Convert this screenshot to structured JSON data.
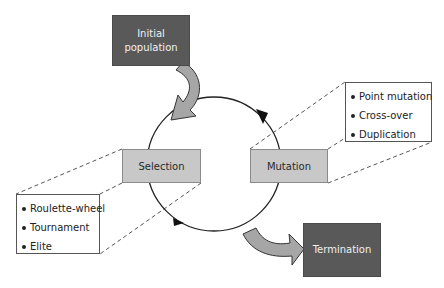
{
  "diagram": {
    "initial": {
      "label": "Initial population"
    },
    "selection": {
      "label": "Selection",
      "methods": [
        "Roulette-wheel",
        "Tournament",
        "Elite"
      ]
    },
    "mutation": {
      "label": "Mutation",
      "methods": [
        "Point mutation",
        "Cross-over",
        "Duplication"
      ]
    },
    "termination": {
      "label": "Termination"
    },
    "colors": {
      "dark_box": "#595959",
      "light_box": "#c8c8c8",
      "arrow_fill": "#a6a6a6",
      "line": "#222222"
    }
  }
}
